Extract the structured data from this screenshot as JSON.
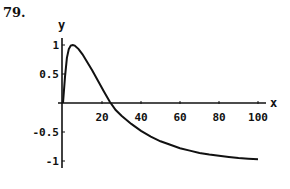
{
  "problem_number": "79.",
  "chart_data": {
    "type": "line",
    "title": "",
    "xlabel": "x",
    "ylabel": "y",
    "xlim": [
      0,
      100
    ],
    "ylim": [
      -1.15,
      1.15
    ],
    "grid": false,
    "legend": null,
    "x_ticks": [
      20,
      40,
      60,
      80,
      100
    ],
    "x_tick_labels": [
      "20",
      "40",
      "60",
      "80",
      "100"
    ],
    "y_ticks": [
      1,
      0.5,
      -0.5,
      -1
    ],
    "y_tick_labels": [
      "1",
      "0.5",
      "-0.5",
      "-1"
    ],
    "series": [
      {
        "name": "y(x)",
        "x": [
          0,
          1,
          2,
          3,
          4,
          5,
          6,
          8,
          10,
          12,
          15,
          18,
          21,
          24,
          27,
          30,
          35,
          40,
          45,
          50,
          55,
          60,
          65,
          70,
          75,
          80,
          85,
          90,
          95,
          100
        ],
        "y": [
          0,
          0.45,
          0.78,
          0.93,
          0.99,
          1.0,
          0.99,
          0.93,
          0.84,
          0.73,
          0.56,
          0.38,
          0.2,
          0.02,
          -0.12,
          -0.22,
          -0.36,
          -0.48,
          -0.58,
          -0.66,
          -0.72,
          -0.78,
          -0.82,
          -0.86,
          -0.89,
          -0.91,
          -0.93,
          -0.95,
          -0.96,
          -0.97
        ]
      }
    ]
  }
}
